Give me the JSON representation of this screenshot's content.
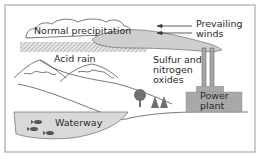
{
  "diagram": {
    "labels": {
      "normal_precipitation": "Normal precipitation",
      "prevailing_winds_line1": "Prevailing",
      "prevailing_winds_line2": "winds",
      "acid_rain": "Acid rain",
      "emissions_line1": "Sulfur and",
      "emissions_line2": "nitrogen",
      "emissions_line3": "oxides",
      "power_plant_line1": "Power",
      "power_plant_line2": "plant",
      "waterway": "Waterway"
    },
    "colors": {
      "border": "#9a9a9a",
      "cloud_fill": "#ffffff",
      "smoke_fill": "#cfcfcf",
      "acid_rain_hatch": "#b5b5b5",
      "plant_fill": "#a8a8a8",
      "water_fill": "#d9d9d9",
      "tree_fill": "#6f6f6f",
      "line": "#555555"
    }
  }
}
